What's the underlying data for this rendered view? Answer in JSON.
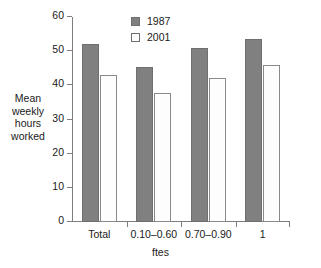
{
  "chart_data": {
    "type": "bar",
    "title": "",
    "xlabel": "ftes",
    "ylabel": "Mean\nweekly\nhours\nworked",
    "categories": [
      "Total",
      "0.10–0.60",
      "0.70–0.90",
      "1"
    ],
    "series": [
      {
        "name": "1987",
        "color": "#808080",
        "values": [
          52,
          45.5,
          51,
          53.5
        ]
      },
      {
        "name": "2001",
        "color": "#ffffff",
        "values": [
          43,
          37.8,
          42,
          46
        ]
      }
    ],
    "ylim": [
      0,
      60
    ],
    "yticks": [
      0,
      10,
      20,
      30,
      40,
      50,
      60
    ],
    "ytick_labels": [
      "0",
      "10",
      "20",
      "30",
      "40",
      "50",
      "60"
    ],
    "grid": false,
    "legend_position": "top-center"
  },
  "legend": {
    "entries": [
      {
        "label": "1987"
      },
      {
        "label": "2001"
      }
    ]
  }
}
